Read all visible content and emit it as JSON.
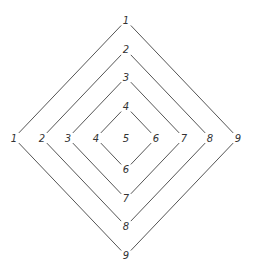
{
  "diagram": {
    "center": {
      "x": 126,
      "y": 138,
      "label": "5"
    },
    "rings": [
      {
        "top": "1",
        "left": "1",
        "right": "9",
        "bottom": "9",
        "half": 112
      },
      {
        "top": "2",
        "left": "2",
        "right": "8",
        "bottom": "8",
        "half": 84
      },
      {
        "top": "3",
        "left": "3",
        "right": "7",
        "bottom": "7",
        "half": 58
      },
      {
        "top": "4",
        "left": "4",
        "right": "6",
        "bottom": "6",
        "half": 30
      }
    ]
  },
  "colors": {
    "line": "#555555",
    "text": "#333333",
    "background": "#ffffff"
  }
}
